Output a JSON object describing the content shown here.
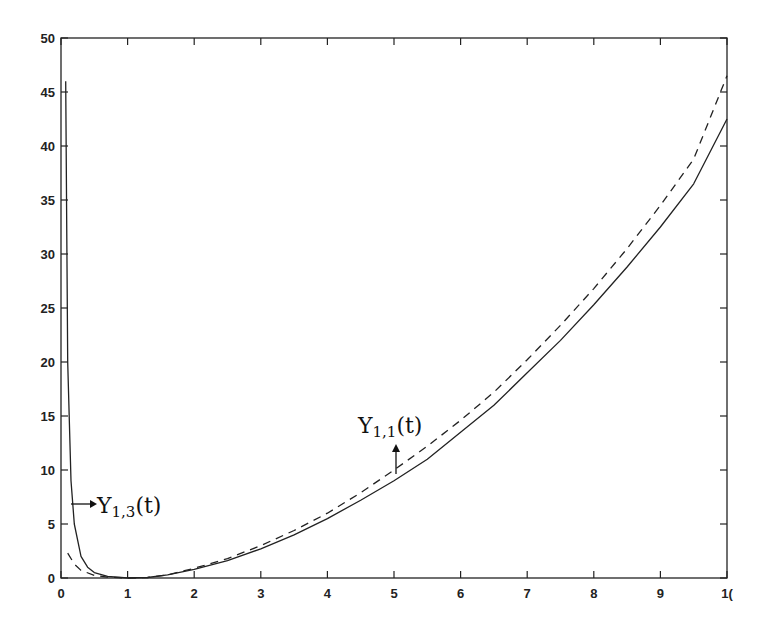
{
  "chart_data": {
    "type": "line",
    "title": "",
    "xlabel": "",
    "ylabel": "",
    "xlim": [
      0,
      10
    ],
    "ylim": [
      0,
      50
    ],
    "grid": false,
    "legend": null,
    "x_ticks": [
      0,
      1,
      2,
      3,
      4,
      5,
      6,
      7,
      8,
      9,
      10
    ],
    "x_tick_labels": [
      "0",
      "1",
      "2",
      "3",
      "4",
      "5",
      "6",
      "7",
      "8",
      "9",
      "1("
    ],
    "y_ticks": [
      0,
      5,
      10,
      15,
      20,
      25,
      30,
      35,
      40,
      45,
      50
    ],
    "y_tick_labels": [
      "0",
      "5",
      "10",
      "15",
      "20",
      "25",
      "30",
      "35",
      "40",
      "45",
      "50"
    ],
    "series": [
      {
        "name": "solid",
        "style": "solid",
        "x": [
          0.07,
          0.1,
          0.15,
          0.2,
          0.3,
          0.4,
          0.5,
          0.7,
          1.0,
          1.3,
          1.6,
          2.0,
          2.5,
          3.0,
          3.5,
          4.0,
          4.5,
          5.0,
          5.5,
          6.0,
          6.5,
          7.0,
          7.5,
          8.0,
          8.5,
          9.0,
          9.5,
          10.0
        ],
        "y": [
          46.0,
          20.0,
          9.0,
          5.0,
          2.0,
          1.0,
          0.5,
          0.15,
          0.0,
          0.05,
          0.3,
          0.8,
          1.6,
          2.7,
          4.0,
          5.5,
          7.2,
          9.0,
          11.0,
          13.5,
          16.0,
          19.0,
          22.0,
          25.3,
          28.8,
          32.5,
          36.5,
          42.5
        ]
      },
      {
        "name": "dashed",
        "style": "dashed",
        "x": [
          0.1,
          0.2,
          0.3,
          0.5,
          0.7,
          1.0,
          1.3,
          1.6,
          2.0,
          2.5,
          3.0,
          3.5,
          4.0,
          4.5,
          5.0,
          5.5,
          6.0,
          6.5,
          7.0,
          7.5,
          8.0,
          8.5,
          9.0,
          9.5,
          10.0
        ],
        "y": [
          2.3,
          1.3,
          0.7,
          0.25,
          0.08,
          0.0,
          0.05,
          0.3,
          0.9,
          1.8,
          3.0,
          4.4,
          6.0,
          7.9,
          10.0,
          12.2,
          14.6,
          17.2,
          20.2,
          23.4,
          26.8,
          30.5,
          34.5,
          38.8,
          46.5
        ]
      }
    ],
    "annotations": [
      {
        "text_main": "Υ",
        "subscript": "1,3",
        "suffix": "(t)",
        "label": "Υ1,3(t)",
        "x": 0.55,
        "y": 6.7,
        "arrow": "left-pointing arrow from curve at t≈0.15"
      },
      {
        "text_main": "Υ",
        "subscript": "1,1",
        "suffix": "(t)",
        "label": "Υ1,1(t)",
        "x": 4.5,
        "y": 13.0,
        "arrow": "vertical double arrow at t≈5 between curves"
      }
    ]
  }
}
